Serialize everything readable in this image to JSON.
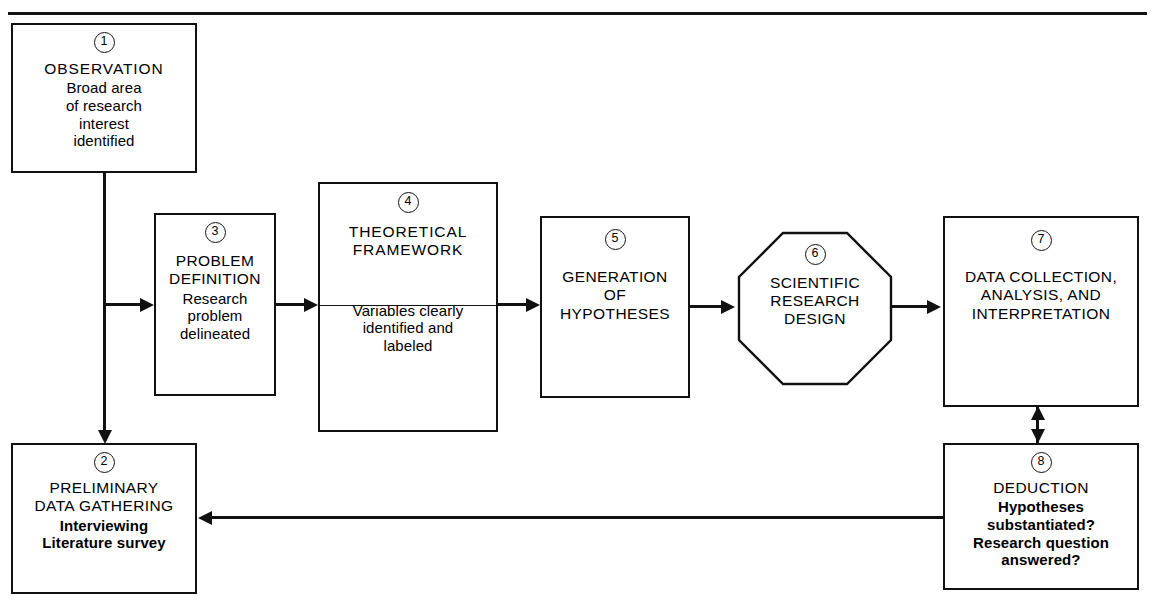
{
  "figure": {
    "type": "flowchart",
    "orientation": "left-to-right with feedback loop",
    "clipped_header_fragment": ""
  },
  "nodes": [
    {
      "id": "observation",
      "number": "1",
      "shape": "rectangle",
      "title": "OBSERVATION",
      "subtitle": "Broad area\nof research\ninterest\nidentified",
      "subtitle_bold": false
    },
    {
      "id": "preliminary-data-gathering",
      "number": "2",
      "shape": "rectangle",
      "title": "PRELIMINARY\nDATA GATHERING",
      "subtitle": "Interviewing\nLiterature survey",
      "subtitle_bold": true
    },
    {
      "id": "problem-definition",
      "number": "3",
      "shape": "rectangle",
      "title": "PROBLEM\nDEFINITION",
      "subtitle": "Research\nproblem\ndelineated",
      "subtitle_bold": false
    },
    {
      "id": "theoretical-framework",
      "number": "4",
      "shape": "rectangle-divided",
      "title": "THEORETICAL\nFRAMEWORK",
      "subtitle": "Variables clearly\nidentified and\nlabeled",
      "subtitle_bold": false
    },
    {
      "id": "generation-of-hypotheses",
      "number": "5",
      "shape": "rectangle",
      "title": "GENERATION\nOF\nHYPOTHESES",
      "subtitle": "",
      "subtitle_bold": false
    },
    {
      "id": "scientific-research-design",
      "number": "6",
      "shape": "octagon",
      "title": "SCIENTIFIC\nRESEARCH\nDESIGN",
      "subtitle": "",
      "subtitle_bold": false
    },
    {
      "id": "data-collection-analysis-interpretation",
      "number": "7",
      "shape": "rectangle",
      "title": "DATA COLLECTION,\nANALYSIS, AND\nINTERPRETATION",
      "subtitle": "",
      "subtitle_bold": false
    },
    {
      "id": "deduction",
      "number": "8",
      "shape": "rectangle",
      "title": "DEDUCTION",
      "subtitle": "Hypotheses\nsubstantiated?\nResearch question\nanswered?",
      "subtitle_bold": true
    }
  ],
  "edges": [
    {
      "id": "e1",
      "from": "1",
      "to": "3",
      "style": "single-arrow"
    },
    {
      "id": "e2",
      "from": "1",
      "to": "2",
      "style": "single-arrow"
    },
    {
      "id": "e3",
      "from": "3",
      "to": "4",
      "style": "single-arrow"
    },
    {
      "id": "e4",
      "from": "4",
      "to": "5",
      "style": "single-arrow"
    },
    {
      "id": "e5",
      "from": "5",
      "to": "6",
      "style": "single-arrow"
    },
    {
      "id": "e6",
      "from": "6",
      "to": "7",
      "style": "single-arrow"
    },
    {
      "id": "e7",
      "from": "7",
      "to": "8",
      "style": "double-arrow"
    },
    {
      "id": "e8",
      "from": "8",
      "to": "2",
      "style": "single-arrow-feedback"
    }
  ],
  "colors": {
    "ink": "#111111",
    "background": "#ffffff"
  }
}
